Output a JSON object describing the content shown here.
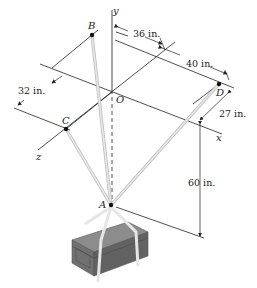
{
  "points": {
    "A": "A",
    "B": "B",
    "C": "C",
    "D": "D",
    "O": "O"
  },
  "axes": {
    "x": "x",
    "y": "y",
    "z": "z"
  },
  "dimensions": {
    "d_36": "36 in.",
    "d_40": "40 in.",
    "d_32": "32 in.",
    "d_27": "27 in.",
    "d_60": "60 in."
  },
  "colors": {
    "line": "#222222",
    "cable": "#cfcfcf",
    "crate_top": "#8a8a8a",
    "crate_side": "#6e6e6e",
    "strap": "#e6e6e6"
  }
}
